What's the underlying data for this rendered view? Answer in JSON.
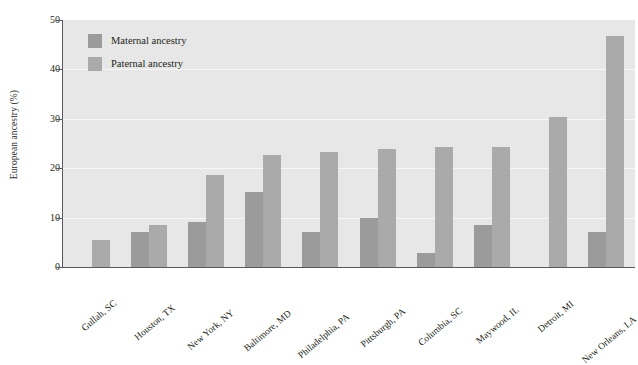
{
  "chart_data": {
    "type": "bar",
    "title": "",
    "xlabel": "",
    "ylabel": "European ancestry (%)",
    "ylim": [
      0,
      50
    ],
    "yticks": [
      0,
      10,
      20,
      30,
      40,
      50
    ],
    "grid": true,
    "legend_position": "upper-left",
    "categories": [
      "Gullah, SC",
      "Houston, TX",
      "New York, NY",
      "Baltimore, MD",
      "Philadelphia, PA",
      "Pittsburgh, PA",
      "Columbia, SC",
      "Maywood, IL",
      "Detroit, MI",
      "New Orleans, LA"
    ],
    "series": [
      {
        "name": "Maternal ancestry",
        "color": "#9b9b9b",
        "values": [
          null,
          7.0,
          9.1,
          15.1,
          7.0,
          10.0,
          2.8,
          8.5,
          null,
          7.1
        ]
      },
      {
        "name": "Paternal ancestry",
        "color": "#aaaaaa",
        "values": [
          5.5,
          8.5,
          18.6,
          22.7,
          23.2,
          23.9,
          24.3,
          24.2,
          30.3,
          46.7
        ]
      }
    ]
  },
  "legend": {
    "items": [
      {
        "label": "Maternal ancestry",
        "color": "#9b9b9b"
      },
      {
        "label": "Paternal ancestry",
        "color": "#aaaaaa"
      }
    ]
  },
  "axes": {
    "y_title": "European ancestry (%)",
    "y_tick_labels": [
      "50",
      "40",
      "30",
      "20",
      "10",
      "0"
    ]
  },
  "colors": {
    "plot_background": "#e7e7e7",
    "gridline": "#f7f7f7",
    "axis": "#58595b",
    "text": "#231f20",
    "maternal": "#9b9b9b",
    "paternal": "#aaaaaa"
  }
}
